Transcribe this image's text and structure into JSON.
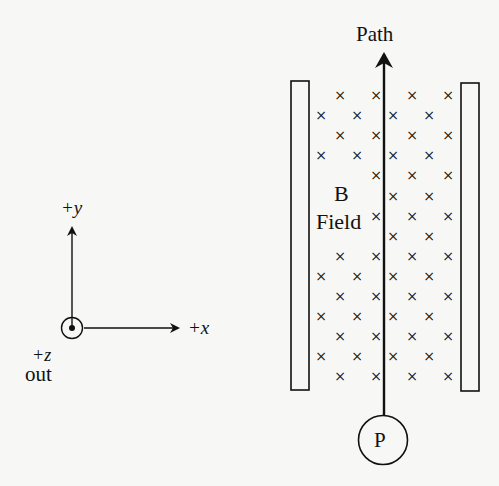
{
  "labels": {
    "path": "Path",
    "b_field_line1": "B",
    "b_field_line2": "Field",
    "particle": "P",
    "axis_y": "+y",
    "axis_x": "+x",
    "axis_z": "+z",
    "axis_z_direction": "out"
  },
  "field": {
    "symbol": "×",
    "direction": "into page",
    "rows": 15,
    "odd_row_columns": [
      321,
      357,
      393,
      429
    ],
    "even_row_columns": [
      340,
      376,
      412,
      448
    ]
  },
  "colors": {
    "ink": "#111111",
    "background": "#f7f7f5"
  }
}
